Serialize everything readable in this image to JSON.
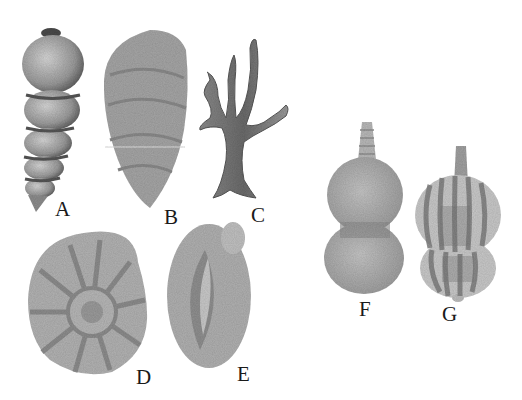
{
  "figure": {
    "background": "#ffffff",
    "ink_color": "#1a1a1a",
    "specimens": [
      {
        "id": "A",
        "label": "A",
        "shape": "high-spired multi-chambered shell",
        "label_pos": [
          55,
          199
        ]
      },
      {
        "id": "B",
        "label": "B",
        "shape": "elongated leaf-like test",
        "label_pos": [
          164,
          207
        ]
      },
      {
        "id": "C",
        "label": "C",
        "shape": "branching coral-like form",
        "label_pos": [
          251,
          205
        ]
      },
      {
        "id": "D",
        "label": "D",
        "shape": "planispiral coiled test with radial chambers",
        "label_pos": [
          136,
          367
        ]
      },
      {
        "id": "E",
        "label": "E",
        "shape": "ovoid test with elongate chamber",
        "label_pos": [
          237,
          364
        ]
      },
      {
        "id": "F",
        "label": "F",
        "shape": "two-chambered flask-shaped test with neck",
        "label_pos": [
          359,
          299
        ]
      },
      {
        "id": "G",
        "label": "G",
        "shape": "two-chambered ribbed flask-shaped test with neck",
        "label_pos": [
          442,
          304
        ]
      }
    ]
  }
}
